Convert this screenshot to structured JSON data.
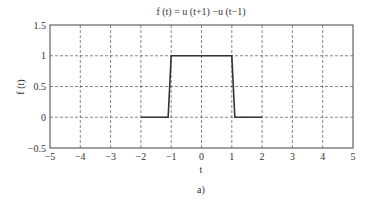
{
  "chart_data": {
    "type": "line",
    "title": "f (t) = u (t+1) −u (t−1)",
    "xlabel": "t",
    "ylabel": "f (t)",
    "caption": "a)",
    "xlim": [
      -5,
      5
    ],
    "ylim": [
      -0.5,
      1.5
    ],
    "xticks": [
      -5,
      -4,
      -3,
      -2,
      -1,
      0,
      1,
      2,
      3,
      4,
      5
    ],
    "xtick_labels": [
      "−5",
      "−4",
      "−3",
      "−2",
      "−1",
      "0",
      "1",
      "2",
      "3",
      "4",
      "5"
    ],
    "yticks": [
      -0.5,
      0,
      0.5,
      1,
      1.5
    ],
    "ytick_labels": [
      "−0.5",
      "0",
      "0.5",
      "1",
      "1.5"
    ],
    "grid": true,
    "grid_style": "dashed",
    "legend": null,
    "series": [
      {
        "name": "f(t)",
        "color": "#333333",
        "x": [
          -2,
          -1.1,
          -1,
          1,
          1.1,
          2
        ],
        "y": [
          0,
          0,
          1,
          1,
          0,
          0
        ]
      }
    ]
  }
}
